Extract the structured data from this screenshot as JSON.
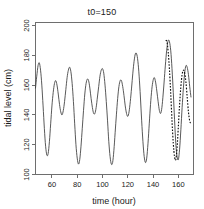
{
  "chart_data": {
    "type": "line",
    "title": "t0=150",
    "xlabel": "time (hour)",
    "ylabel": "tidal level (cm)",
    "xlim": [
      47,
      172
    ],
    "ylim": [
      100,
      202
    ],
    "xticks": [
      60,
      80,
      100,
      120,
      140,
      160
    ],
    "yticks": [
      100,
      120,
      140,
      160,
      180,
      200
    ],
    "xtick_labels": [
      "60",
      "80",
      "100",
      "120",
      "140",
      "160"
    ],
    "ytick_labels": [
      "100",
      "120",
      "140",
      "160",
      "180",
      "200"
    ],
    "grid": false,
    "legend": "none",
    "forecast_start": 150,
    "series": [
      {
        "name": "observed",
        "style": "solid",
        "color": "#3b3b3b",
        "x": [
          47,
          48,
          49,
          50,
          51,
          52,
          53,
          54,
          55,
          56,
          57,
          58,
          59,
          60,
          61,
          62,
          63,
          64,
          65,
          66,
          67,
          68,
          69,
          70,
          71,
          72,
          73,
          74,
          75,
          76,
          77,
          78,
          79,
          80,
          81,
          82,
          83,
          84,
          85,
          86,
          87,
          88,
          89,
          90,
          91,
          92,
          93,
          94,
          95,
          96,
          97,
          98,
          99,
          100,
          101,
          102,
          103,
          104,
          105,
          106,
          107,
          108,
          109,
          110,
          111,
          112,
          113,
          114,
          115,
          116,
          117,
          118,
          119,
          120,
          121,
          122,
          123,
          124,
          125,
          126,
          127,
          128,
          129,
          130,
          131,
          132,
          133,
          134,
          135,
          136,
          137,
          138,
          139,
          140,
          141,
          142,
          143,
          144,
          145,
          146,
          147,
          148,
          149,
          150,
          151,
          152,
          153,
          154,
          155,
          156,
          157,
          158,
          159,
          160,
          161,
          162,
          163,
          164,
          165,
          166,
          167,
          168,
          169,
          170
        ],
        "y": [
          158,
          166,
          173,
          175,
          170,
          160,
          146,
          131,
          119,
          113,
          114,
          122,
          134,
          146,
          155,
          161,
          163,
          160,
          154,
          147,
          142,
          140,
          143,
          149,
          157,
          165,
          170,
          172,
          169,
          161,
          149,
          134,
          120,
          111,
          107,
          110,
          119,
          131,
          143,
          154,
          161,
          164,
          163,
          158,
          151,
          145,
          141,
          141,
          145,
          152,
          159,
          166,
          170,
          171,
          168,
          160,
          149,
          136,
          122,
          112,
          107,
          108,
          116,
          128,
          140,
          151,
          159,
          163,
          163,
          159,
          153,
          146,
          141,
          139,
          142,
          149,
          158,
          168,
          176,
          181,
          181,
          176,
          166,
          152,
          136,
          122,
          112,
          108,
          111,
          121,
          134,
          147,
          157,
          163,
          165,
          162,
          156,
          149,
          143,
          141,
          145,
          154,
          165,
          176,
          185,
          190,
          189,
          183,
          171,
          155,
          137,
          121,
          112,
          110,
          117,
          130,
          145,
          158,
          168,
          173,
          172,
          167,
          159,
          152
        ]
      },
      {
        "name": "forecast",
        "style": "dashed",
        "color": "#101010",
        "x": [
          150,
          151,
          152,
          153,
          154,
          155,
          156,
          157,
          158,
          159,
          160,
          161,
          162,
          163,
          164,
          165,
          166,
          167,
          168,
          169,
          170
        ],
        "y": [
          190,
          189,
          182,
          170,
          154,
          136,
          121,
          112,
          110,
          118,
          132,
          147,
          159,
          167,
          170,
          168,
          162,
          152,
          142,
          136,
          134
        ]
      }
    ]
  }
}
